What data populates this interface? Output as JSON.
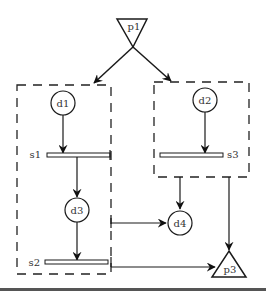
{
  "diagram": {
    "type": "petri-net-like flow diagram",
    "nodes": {
      "p1": {
        "label": "p1",
        "shape": "inverted-triangle"
      },
      "p3": {
        "label": "p3",
        "shape": "triangle"
      },
      "d1": {
        "label": "d1",
        "shape": "circle"
      },
      "d2": {
        "label": "d2",
        "shape": "circle"
      },
      "d3": {
        "label": "d3",
        "shape": "circle"
      },
      "d4": {
        "label": "d4",
        "shape": "circle"
      },
      "s1": {
        "label": "s1",
        "shape": "bar"
      },
      "s2": {
        "label": "s2",
        "shape": "bar"
      },
      "s3": {
        "label": "s3",
        "shape": "bar"
      }
    },
    "groups": [
      {
        "name": "left-group",
        "members": [
          "d1",
          "s1",
          "d3",
          "s2"
        ]
      },
      {
        "name": "right-group",
        "members": [
          "d2",
          "s3"
        ]
      }
    ],
    "edges": [
      {
        "from": "p1",
        "to": "left-group"
      },
      {
        "from": "p1",
        "to": "right-group"
      },
      {
        "from": "d1",
        "to": "s1"
      },
      {
        "from": "s1",
        "to": "d3"
      },
      {
        "from": "d3",
        "to": "s2"
      },
      {
        "from": "d2",
        "to": "s3"
      },
      {
        "from": "right-group",
        "to": "d4"
      },
      {
        "from": "left-group",
        "to": "d4"
      },
      {
        "from": "right-group",
        "to": "p3"
      },
      {
        "from": "left-group",
        "to": "p3"
      }
    ]
  },
  "colors": {
    "line": "#1a1a1a",
    "background": "#ffffff",
    "bottom_rule": "#555555"
  }
}
